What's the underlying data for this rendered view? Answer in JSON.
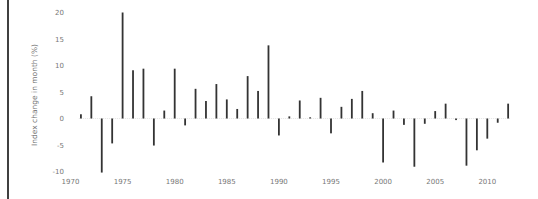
{
  "chart_data": {
    "type": "bar",
    "title": "",
    "xlabel": "",
    "ylabel": "Index change in month (%)",
    "ylim": [
      -10,
      20
    ],
    "xlim": [
      1970,
      2012
    ],
    "grid": false,
    "legend": null,
    "x_ticks": [
      1970,
      1975,
      1980,
      1985,
      1990,
      1995,
      2000,
      2005,
      2010
    ],
    "y_ticks": [
      -10,
      -5,
      0,
      5,
      10,
      15,
      20
    ],
    "categories": [
      1971,
      1972,
      1973,
      1974,
      1975,
      1976,
      1977,
      1978,
      1979,
      1980,
      1981,
      1982,
      1983,
      1984,
      1985,
      1986,
      1987,
      1988,
      1989,
      1990,
      1991,
      1992,
      1993,
      1994,
      1995,
      1996,
      1997,
      1998,
      1999,
      2000,
      2001,
      2002,
      2003,
      2004,
      2005,
      2006,
      2007,
      2008,
      2009,
      2010,
      2011,
      2012
    ],
    "values": [
      0.8,
      4.2,
      -10.2,
      -4.7,
      20.0,
      9.1,
      9.4,
      -5.1,
      1.5,
      9.4,
      -1.3,
      5.6,
      3.3,
      6.5,
      3.6,
      1.8,
      8.0,
      5.2,
      13.8,
      -3.2,
      0.4,
      3.4,
      0.2,
      3.9,
      -2.8,
      2.2,
      3.7,
      5.2,
      1.0,
      -8.3,
      1.5,
      -1.2,
      -9.1,
      -1.0,
      1.4,
      2.8,
      -0.3,
      -8.9,
      -6.0,
      -3.8,
      -0.8,
      2.8
    ],
    "colors": {
      "bar": "#333333",
      "text": "#777777",
      "frame": "#000000",
      "zero_line": "#dddddd"
    }
  }
}
